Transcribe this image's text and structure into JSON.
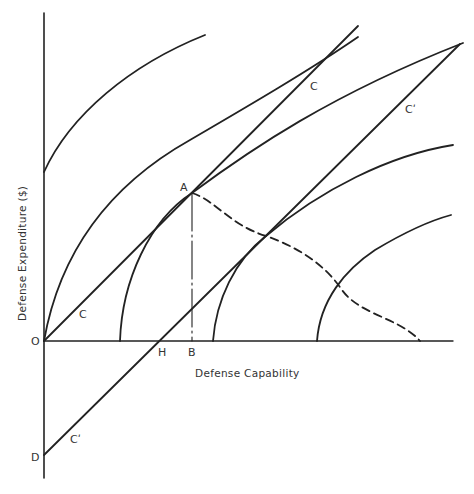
{
  "diagram": {
    "title": "",
    "axes": {
      "x_label": "Defense Capability",
      "y_label": "Defense Expenditure ($)"
    },
    "points": {
      "O": "O",
      "D": "D",
      "H": "H",
      "B": "B",
      "A": "A"
    },
    "lines": {
      "C_label_upper": "C",
      "C_label_lower": "C",
      "C_prime_label_upper": "Cʹ",
      "C_prime_label_lower": "Cʹ"
    },
    "colors": {
      "ink": "#222222",
      "background": "#ffffff"
    }
  }
}
